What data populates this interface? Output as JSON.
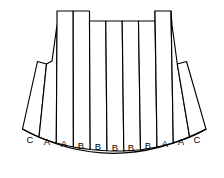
{
  "figure": {
    "shape_name": "skirt-fan-panels",
    "background_color": "#ffffff",
    "stroke_color": "#000000",
    "fill_color": "#ffffff",
    "panel_count": 11,
    "labels": [
      "C",
      "A",
      "A",
      "B",
      "B",
      "B",
      "B",
      "B",
      "A",
      "A",
      "C"
    ],
    "top_profile": "castellated",
    "top_profile_description": "two tall outer blocks with a lower recessed middle section",
    "panels": [
      {
        "index": 0,
        "label": "C",
        "group": "C",
        "top_level": "dropped",
        "label_x": 29,
        "label_y": 140
      },
      {
        "index": 1,
        "label": "A",
        "group": "A",
        "top_level": "dropped",
        "label_x": 46,
        "label_y": 142
      },
      {
        "index": 2,
        "label": "A",
        "group": "A",
        "top_level": "tall",
        "label_x": 63,
        "label_y": 144
      },
      {
        "index": 3,
        "label": "B",
        "group": "B",
        "top_level": "tall",
        "label_x": 80,
        "label_y": 146
      },
      {
        "index": 4,
        "label": "B",
        "group": "B",
        "top_level": "middle",
        "label_x": 97,
        "label_y": 147
      },
      {
        "index": 5,
        "label": "B",
        "group": "B",
        "top_level": "middle",
        "label_x": 114,
        "label_y": 147
      },
      {
        "index": 6,
        "label": "B",
        "group": "B",
        "top_level": "middle",
        "label_x": 131,
        "label_y": 147
      },
      {
        "index": 7,
        "label": "B",
        "group": "B",
        "top_level": "middle",
        "label_x": 147,
        "label_y": 146
      },
      {
        "index": 8,
        "label": "A",
        "group": "A",
        "top_level": "tall",
        "label_x": 164,
        "label_y": 144
      },
      {
        "index": 9,
        "label": "A",
        "group": "A",
        "top_level": "tall",
        "label_x": 180,
        "label_y": 142
      },
      {
        "index": 10,
        "label": "C",
        "group": "C",
        "top_level": "dropped",
        "label_x": 196,
        "label_y": 140
      }
    ],
    "geometry": {
      "top_tall_y": 11,
      "top_middle_y": 21,
      "top_dropped_y_left": 63,
      "top_dropped_y_right": 63,
      "bottom_arc_center_y": 164,
      "bottom_arc_edge_y": 133,
      "left_extent_x": 14,
      "right_extent_x": 211
    }
  }
}
